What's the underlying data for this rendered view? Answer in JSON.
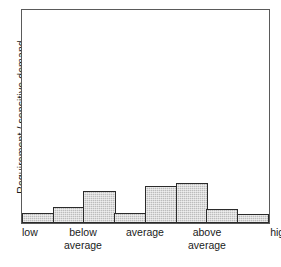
{
  "chart_data": {
    "type": "bar",
    "title": "",
    "subtitle": "",
    "xlabel": "",
    "ylabel": "Requirement / sensitive demand",
    "categories": [
      "low",
      "",
      "below average",
      "",
      "average",
      "",
      "above average",
      "high"
    ],
    "tick_labels": [
      {
        "line1": "low",
        "line2": ""
      },
      {
        "line1": "below",
        "line2": "average"
      },
      {
        "line1": "average",
        "line2": ""
      },
      {
        "line1": "above",
        "line2": "average"
      },
      {
        "line1": "high",
        "line2": ""
      }
    ],
    "values": [
      10,
      16,
      32,
      10,
      37,
      40,
      14,
      9
    ],
    "bar_count": 8,
    "ylim": [
      0,
      215
    ],
    "xlim": [
      0,
      8
    ],
    "grid": false,
    "legend": false,
    "legend_position": "none",
    "bar_fill_color": "#bcbcbc",
    "bar_border_color": "#2b2b2b",
    "frame_color": "#5a5a5a",
    "background_color": "#ffffff",
    "axis_tick_marks": false,
    "y_tick_labels": []
  },
  "labels": {
    "y_axis_title": "Requirement / sensitive demand",
    "x_tick_low": "low",
    "x_tick_below_1": "below",
    "x_tick_below_2": "average",
    "x_tick_average": "average",
    "x_tick_above_1": "above",
    "x_tick_above_2": "average",
    "x_tick_high": "high",
    "bottom_caption": ""
  }
}
